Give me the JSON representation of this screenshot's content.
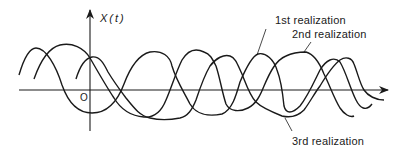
{
  "figure": {
    "y_axis_label": "X(t)",
    "origin_label": "O",
    "stroke_color": "#1a1a1a",
    "background": "#ffffff"
  },
  "axes": {
    "x_axis": {
      "x1": 19,
      "x2": 388,
      "y": 90
    },
    "y_axis": {
      "x": 90,
      "y1": 131,
      "y2": 10
    }
  },
  "realizations": [
    {
      "label": "1st realization",
      "label_pos": {
        "x": 275,
        "y": 15
      },
      "leader": {
        "x1": 266,
        "y1": 29,
        "x2": 257,
        "y2": 55
      },
      "path": "M19,75 C24,58 30,48 36,48 C46,48 56,66 62,85 C68,102 78,113 92,113 C108,113 118,100 124,84 C130,68 138,55 150,52 C162,50 170,56 172,66 C176,80 184,92 190,104 C196,114 208,117 222,114 C232,110 236,96 240,82 C246,68 252,56 258,54 C266,52 274,60 277,70 C281,80 283,96 284,106 C286,114 292,114 300,106 C308,96 314,82 320,70 C326,60 334,56 340,62 C346,72 350,88 356,100 C360,108 366,112 372,104"
    },
    {
      "label": "2nd realization",
      "label_pos": {
        "x": 292,
        "y": 29
      },
      "leader": {
        "x1": 311,
        "y1": 42,
        "x2": 304,
        "y2": 52
      },
      "path": "M34,79 C40,62 48,48 60,45 C72,42 84,48 90,58 C98,72 106,86 114,98 C120,108 130,116 144,117 C156,118 162,110 166,100 C172,86 176,72 182,60 C188,50 196,48 204,52 C210,54 212,58 216,66 C220,78 222,92 226,104 C230,112 240,112 248,108 C256,104 260,96 264,86 C270,72 276,60 286,56 C294,52 302,52 306,52 C314,54 320,64 324,74 C330,86 334,98 340,108 C344,114 350,118 354,116"
    },
    {
      "label": "3rd realization",
      "label_pos": {
        "x": 292,
        "y": 136
      },
      "leader": {
        "x1": 292,
        "y1": 131,
        "x2": 285,
        "y2": 118
      },
      "path": "M76,79 C80,66 86,58 92,57 C100,56 104,64 108,72 C114,82 120,90 126,98 C134,108 140,116 150,118 C158,120 170,120 180,118 C188,116 192,110 196,100 C200,88 204,76 210,66 C216,58 224,54 230,56 C236,58 238,66 242,74 C246,84 250,96 256,102 C262,108 272,112 282,116 C290,118 298,116 304,110 C310,102 314,94 320,86 C326,76 332,66 340,60 C346,56 352,58 354,64 C358,74 360,84 364,90 C368,96 376,100 384,100"
    }
  ]
}
